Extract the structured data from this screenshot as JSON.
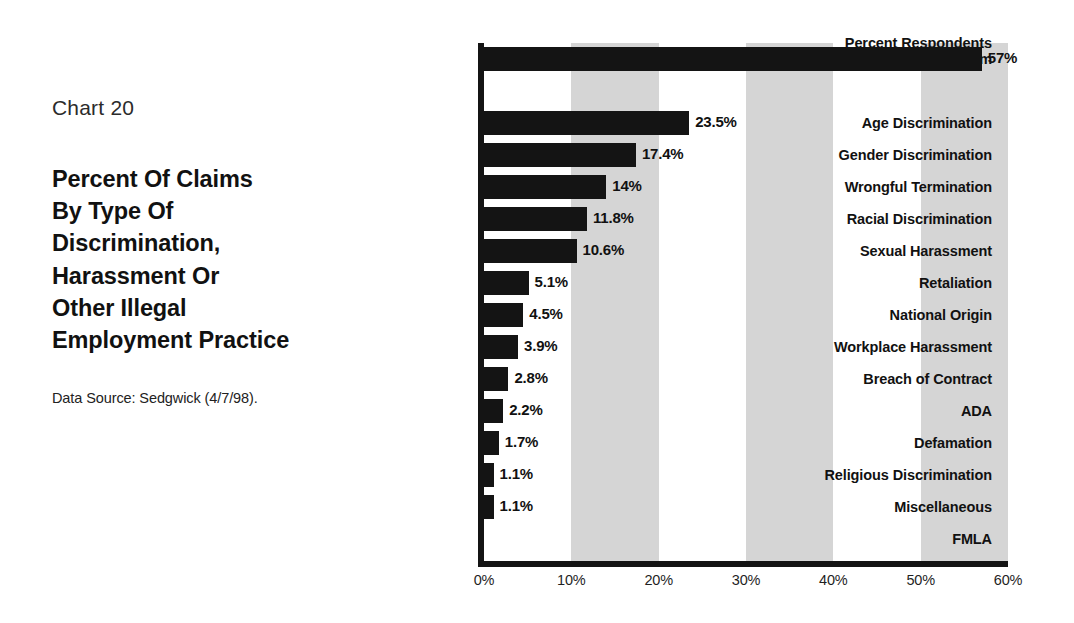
{
  "caption": {
    "chart_number": "Chart 20",
    "title_lines": [
      "Percent Of Claims",
      "By Type Of",
      "Discrimination,",
      "Harassment Or",
      "Other Illegal",
      "Employment Practice"
    ],
    "data_source": "Data Source: Sedgwick (4/7/98)."
  },
  "colors": {
    "bar": "#141414",
    "band": "#d5d5d5",
    "axis": "#141414",
    "background": "#ffffff",
    "text": "#111111"
  },
  "chart_data": {
    "type": "bar",
    "orientation": "horizontal",
    "title": "Percent Of Claims By Type Of Discrimination, Harassment Or Other Illegal Employment Practice",
    "subtitle": "Chart 20",
    "xlabel": "",
    "ylabel": "",
    "xlim": [
      0,
      60
    ],
    "xticks": [
      0,
      10,
      20,
      30,
      40,
      50,
      60
    ],
    "xtick_labels": [
      "0%",
      "10%",
      "20%",
      "30%",
      "40%",
      "50%",
      "60%"
    ],
    "grid": false,
    "legend": false,
    "shaded_bands": [
      [
        10,
        20
      ],
      [
        30,
        40
      ],
      [
        50,
        60
      ]
    ],
    "categories": [
      "Percent Respondents\nReporting a Claim",
      "Age Discrimination",
      "Gender Discrimination",
      "Wrongful Termination",
      "Racial Discrimination",
      "Sexual Harassment",
      "Retaliation",
      "National Origin",
      "Workplace Harassment",
      "Breach of Contract",
      "ADA",
      "Defamation",
      "Religious Discrimination",
      "Miscellaneous",
      "FMLA"
    ],
    "values": [
      57,
      23.5,
      17.4,
      14,
      11.8,
      10.6,
      5.1,
      4.5,
      3.9,
      2.8,
      2.2,
      1.7,
      1.1,
      1.1,
      0
    ],
    "value_labels": [
      "57%",
      "23.5%",
      "17.4%",
      "14%",
      "11.8%",
      "10.6%",
      "5.1%",
      "4.5%",
      "3.9%",
      "2.8%",
      "2.2%",
      "1.7%",
      "1.1%",
      "1.1%",
      ""
    ]
  },
  "rows": [
    {
      "label": "Percent Respondents\nReporting a Claim",
      "value": 57,
      "value_label": "57%",
      "slot": 0,
      "lines": 2
    },
    {
      "label": "",
      "value": null,
      "value_label": "",
      "slot": 1,
      "lines": 0
    },
    {
      "label": "Age Discrimination",
      "value": 23.5,
      "value_label": "23.5%",
      "slot": 2,
      "lines": 1
    },
    {
      "label": "Gender Discrimination",
      "value": 17.4,
      "value_label": "17.4%",
      "slot": 3,
      "lines": 1
    },
    {
      "label": "Wrongful Termination",
      "value": 14,
      "value_label": "14%",
      "slot": 4,
      "lines": 1
    },
    {
      "label": "Racial Discrimination",
      "value": 11.8,
      "value_label": "11.8%",
      "slot": 5,
      "lines": 1
    },
    {
      "label": "Sexual Harassment",
      "value": 10.6,
      "value_label": "10.6%",
      "slot": 6,
      "lines": 1
    },
    {
      "label": "Retaliation",
      "value": 5.1,
      "value_label": "5.1%",
      "slot": 7,
      "lines": 1
    },
    {
      "label": "National Origin",
      "value": 4.5,
      "value_label": "4.5%",
      "slot": 8,
      "lines": 1
    },
    {
      "label": "Workplace Harassment",
      "value": 3.9,
      "value_label": "3.9%",
      "slot": 9,
      "lines": 1
    },
    {
      "label": "Breach of Contract",
      "value": 2.8,
      "value_label": "2.8%",
      "slot": 10,
      "lines": 1
    },
    {
      "label": "ADA",
      "value": 2.2,
      "value_label": "2.2%",
      "slot": 11,
      "lines": 1
    },
    {
      "label": "Defamation",
      "value": 1.7,
      "value_label": "1.7%",
      "slot": 12,
      "lines": 1
    },
    {
      "label": "Religious Discrimination",
      "value": 1.1,
      "value_label": "1.1%",
      "slot": 13,
      "lines": 1
    },
    {
      "label": "Miscellaneous",
      "value": 1.1,
      "value_label": "1.1%",
      "slot": 14,
      "lines": 1
    },
    {
      "label": "FMLA",
      "value": 0,
      "value_label": "",
      "slot": 15,
      "lines": 1
    }
  ]
}
